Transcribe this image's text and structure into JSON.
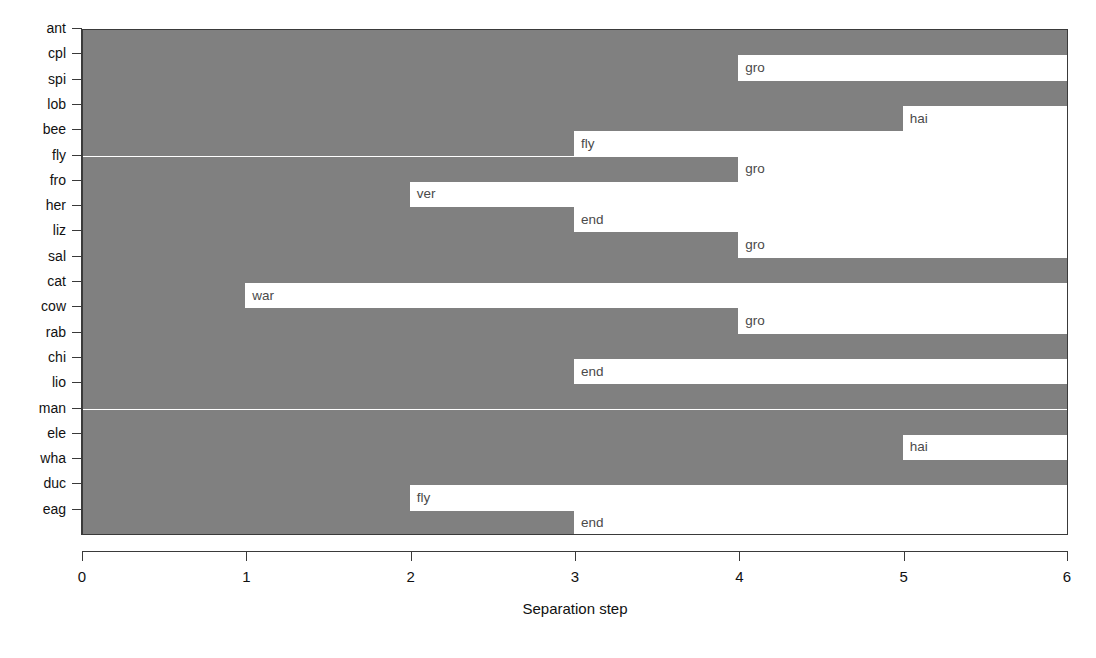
{
  "chart_data": {
    "type": "bar",
    "orientation": "horizontal",
    "title": "",
    "subtitle": "",
    "xlabel": "Separation step",
    "ylabel": "",
    "xlim": [
      0,
      6
    ],
    "xticks": [
      0,
      1,
      2,
      3,
      4,
      5,
      6
    ],
    "xticklabels": [
      "0",
      "1",
      "2",
      "3",
      "4",
      "5",
      "6"
    ],
    "grid": false,
    "legend": null,
    "colors": {
      "bar_gray": "#808080",
      "bar_white": "#ffffff",
      "axis": "#3a3a3a",
      "text": "#111111",
      "bar_label_text": "#4a4a4a",
      "background": "#ffffff"
    },
    "categories": [
      "ant",
      "cpl",
      "spi",
      "lob",
      "bee",
      "fly",
      "fro",
      "her",
      "liz",
      "sal",
      "cat",
      "cow",
      "rab",
      "chi",
      "lio",
      "man",
      "ele",
      "wha",
      "duc",
      "eag"
    ],
    "values": [
      6,
      4,
      6,
      5,
      3,
      4,
      2,
      3,
      4,
      6,
      1,
      4,
      6,
      3,
      6,
      6,
      5,
      6,
      2,
      3
    ],
    "annotations": [
      "",
      "gro",
      "",
      "hai",
      "fly",
      "gro",
      "ver",
      "end",
      "gro",
      "",
      "war",
      "gro",
      "",
      "end",
      "",
      "",
      "hai",
      "",
      "fly",
      "end"
    ],
    "rows": [
      {
        "category": "ant",
        "step": 6,
        "label": ""
      },
      {
        "category": "cpl",
        "step": 4,
        "label": "gro"
      },
      {
        "category": "spi",
        "step": 6,
        "label": ""
      },
      {
        "category": "lob",
        "step": 5,
        "label": "hai"
      },
      {
        "category": "bee",
        "step": 3,
        "label": "fly"
      },
      {
        "category": "fly",
        "step": 4,
        "label": "gro"
      },
      {
        "category": "fro",
        "step": 2,
        "label": "ver"
      },
      {
        "category": "her",
        "step": 3,
        "label": "end"
      },
      {
        "category": "liz",
        "step": 4,
        "label": "gro"
      },
      {
        "category": "sal",
        "step": 6,
        "label": ""
      },
      {
        "category": "cat",
        "step": 1,
        "label": "war"
      },
      {
        "category": "cow",
        "step": 4,
        "label": "gro"
      },
      {
        "category": "rab",
        "step": 6,
        "label": ""
      },
      {
        "category": "chi",
        "step": 3,
        "label": "end"
      },
      {
        "category": "lio",
        "step": 6,
        "label": ""
      },
      {
        "category": "man",
        "step": 6,
        "label": ""
      },
      {
        "category": "ele",
        "step": 5,
        "label": "hai"
      },
      {
        "category": "wha",
        "step": 6,
        "label": ""
      },
      {
        "category": "duc",
        "step": 2,
        "label": "fly"
      },
      {
        "category": "eag",
        "step": 3,
        "label": "end"
      }
    ]
  },
  "axis": {
    "x_title": "Separation step",
    "x_tick_labels": [
      "0",
      "1",
      "2",
      "3",
      "4",
      "5",
      "6"
    ],
    "y_tick_labels": [
      "ant",
      "cpl",
      "spi",
      "lob",
      "bee",
      "fly",
      "fro",
      "her",
      "liz",
      "sal",
      "cat",
      "cow",
      "rab",
      "chi",
      "lio",
      "man",
      "ele",
      "wha",
      "duc",
      "eag"
    ]
  }
}
